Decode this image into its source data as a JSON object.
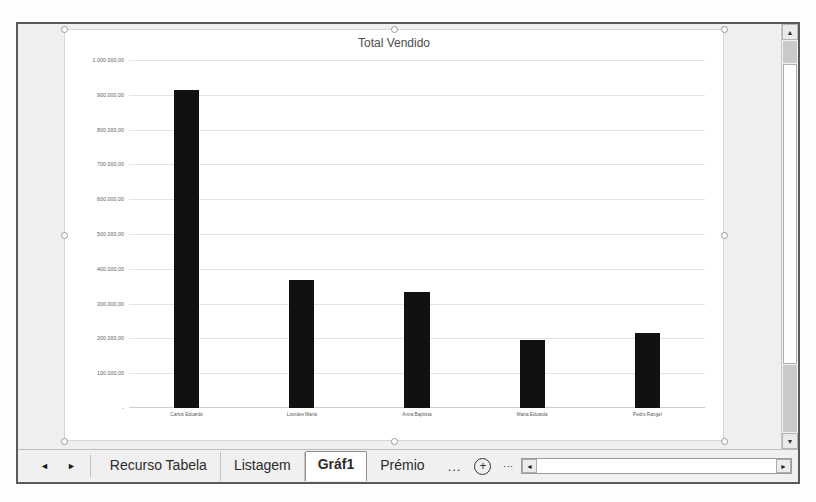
{
  "window": {
    "scrollbars": {
      "vertical_up_icon": "triangle-up-icon",
      "vertical_down_icon": "triangle-down-icon",
      "horizontal_left_icon": "triangle-left-icon",
      "horizontal_right_icon": "triangle-right-icon"
    }
  },
  "tabbar": {
    "nav_prev_icon": "nav-prev-arrow-icon",
    "nav_next_icon": "nav-next-arrow-icon",
    "tabs": [
      {
        "label": "Recurso Tabela",
        "active": false
      },
      {
        "label": "Listagem",
        "active": false
      },
      {
        "label": "Gráf1",
        "active": true
      },
      {
        "label": "Prémio",
        "active": false
      }
    ],
    "overflow_label": "...",
    "add_sheet_icon": "plus-circle-icon",
    "add_sheet_label": "+",
    "more_options_icon": "vertical-ellipsis-icon",
    "more_options_label": "⋮"
  },
  "chart_data": {
    "type": "bar",
    "title": "Total Vendido",
    "xlabel": "",
    "ylabel": "",
    "grid": true,
    "legend": false,
    "ylim": [
      0,
      1000000
    ],
    "ytick_labels": [
      "1.000.000,00",
      "900.000,00",
      "800.000,00",
      "700.000,00",
      "600.000,00",
      "500.000,00",
      "400.000,00",
      "300.000,00",
      "200.000,00",
      "100.000,00",
      "-"
    ],
    "ytick_values": [
      1000000,
      900000,
      800000,
      700000,
      600000,
      500000,
      400000,
      300000,
      200000,
      100000,
      0
    ],
    "categories": [
      "Carlos Eduardo",
      "Lourdes Maria",
      "Anna Baptista",
      "Maria Eduarda",
      "Pedro Rangel"
    ],
    "values": [
      915000,
      368000,
      332000,
      196000,
      215000
    ],
    "series": [
      {
        "name": "Total Vendido",
        "values": [
          915000,
          368000,
          332000,
          196000,
          215000
        ]
      }
    ],
    "bar_color": "#111111"
  }
}
